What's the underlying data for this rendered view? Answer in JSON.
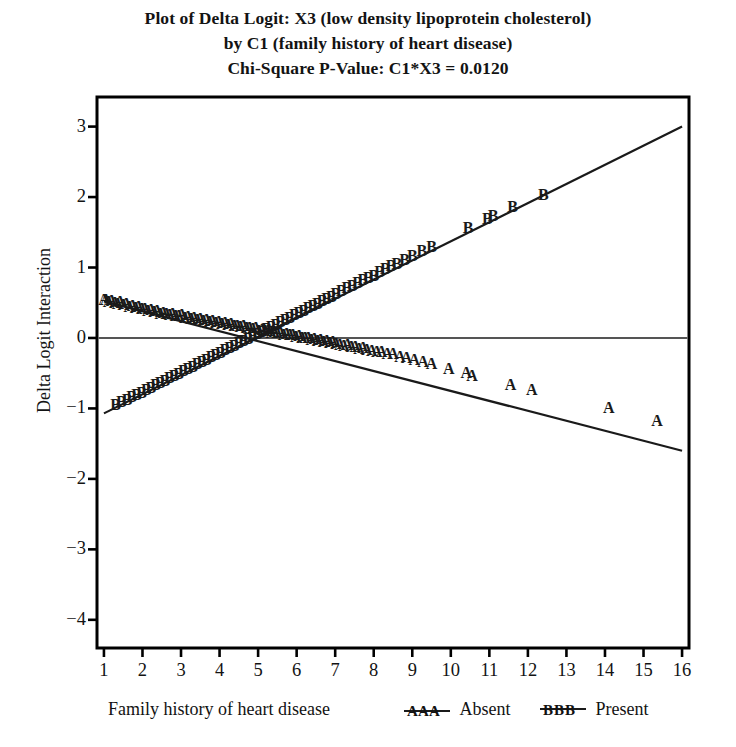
{
  "title": {
    "line1": "Plot of Delta Logit: X3 (low density lipoprotein cholesterol)",
    "line2": "by C1 (family history of heart disease)",
    "line3": "Chi-Square P-Value: C1*X3 = 0.0120"
  },
  "legend": {
    "title": "Family history of heart disease",
    "entries": [
      {
        "symbol": "AAA",
        "label": "Absent"
      },
      {
        "symbol": "BBB",
        "label": "Present"
      }
    ]
  },
  "colors": {
    "line": "#1a1a1a",
    "frame": "#000000",
    "zero_line": "#555555",
    "background": "#ffffff",
    "text": "#131313"
  },
  "chart_data": {
    "type": "scatter",
    "title": "Plot of Delta Logit: X3 (low density lipoprotein cholesterol) by C1 (family history of heart disease) Chi-Square P-Value: C1*X3 = 0.0120",
    "xlabel": "",
    "ylabel": "Delta Logit Interaction",
    "xlim": [
      0.82,
      16.18
    ],
    "ylim": [
      -4.4,
      3.42
    ],
    "xticks": [
      1,
      2,
      3,
      4,
      5,
      6,
      7,
      8,
      9,
      10,
      11,
      12,
      13,
      14,
      15,
      16
    ],
    "yticks": [
      3,
      2,
      1,
      0,
      -1,
      -2,
      -3,
      -4
    ],
    "ytick_labels": [
      "3",
      "2",
      "1",
      "0",
      "−1",
      "−2",
      "−3",
      "−4"
    ],
    "grid": false,
    "zero_reference_line": 0,
    "legend_position": "below-axes",
    "series": [
      {
        "name": "Absent",
        "marker": "A",
        "fit_line": {
          "x": [
            1,
            16
          ],
          "y": [
            0.52,
            -1.6
          ],
          "slope": -0.1413,
          "intercept": 0.6613
        },
        "points": [
          [
            1.0,
            0.56
          ],
          [
            1.05,
            0.55
          ],
          [
            1.12,
            0.52
          ],
          [
            1.2,
            0.54
          ],
          [
            1.28,
            0.51
          ],
          [
            1.35,
            0.5
          ],
          [
            1.42,
            0.52
          ],
          [
            1.5,
            0.48
          ],
          [
            1.58,
            0.49
          ],
          [
            1.66,
            0.46
          ],
          [
            1.74,
            0.47
          ],
          [
            1.82,
            0.44
          ],
          [
            1.9,
            0.45
          ],
          [
            1.98,
            0.42
          ],
          [
            2.06,
            0.43
          ],
          [
            2.14,
            0.4
          ],
          [
            2.22,
            0.41
          ],
          [
            2.3,
            0.38
          ],
          [
            2.38,
            0.39
          ],
          [
            2.46,
            0.36
          ],
          [
            2.54,
            0.37
          ],
          [
            2.62,
            0.35
          ],
          [
            2.7,
            0.34
          ],
          [
            2.78,
            0.36
          ],
          [
            2.86,
            0.33
          ],
          [
            2.94,
            0.32
          ],
          [
            3.02,
            0.34
          ],
          [
            3.1,
            0.3
          ],
          [
            3.18,
            0.31
          ],
          [
            3.26,
            0.29
          ],
          [
            3.34,
            0.3
          ],
          [
            3.42,
            0.27
          ],
          [
            3.5,
            0.28
          ],
          [
            3.58,
            0.26
          ],
          [
            3.66,
            0.27
          ],
          [
            3.74,
            0.24
          ],
          [
            3.82,
            0.25
          ],
          [
            3.9,
            0.23
          ],
          [
            3.98,
            0.24
          ],
          [
            4.06,
            0.21
          ],
          [
            4.14,
            0.22
          ],
          [
            4.22,
            0.2
          ],
          [
            4.3,
            0.21
          ],
          [
            4.38,
            0.18
          ],
          [
            4.46,
            0.19
          ],
          [
            4.54,
            0.17
          ],
          [
            4.62,
            0.18
          ],
          [
            4.7,
            0.15
          ],
          [
            4.78,
            0.16
          ],
          [
            4.86,
            0.14
          ],
          [
            4.94,
            0.15
          ],
          [
            5.02,
            0.12
          ],
          [
            5.1,
            0.13
          ],
          [
            5.18,
            0.11
          ],
          [
            5.26,
            0.12
          ],
          [
            5.34,
            0.09
          ],
          [
            5.42,
            0.1
          ],
          [
            5.5,
            0.08
          ],
          [
            5.58,
            0.09
          ],
          [
            5.66,
            0.06
          ],
          [
            5.74,
            0.07
          ],
          [
            5.82,
            0.05
          ],
          [
            5.9,
            0.06
          ],
          [
            5.98,
            0.03
          ],
          [
            6.06,
            0.04
          ],
          [
            6.14,
            0.02
          ],
          [
            6.22,
            0.01
          ],
          [
            6.3,
            0.02
          ],
          [
            6.38,
            -0.01
          ],
          [
            6.46,
            0.0
          ],
          [
            6.54,
            -0.03
          ],
          [
            6.62,
            -0.02
          ],
          [
            6.7,
            -0.04
          ],
          [
            6.78,
            -0.03
          ],
          [
            6.86,
            -0.06
          ],
          [
            6.94,
            -0.05
          ],
          [
            7.02,
            -0.07
          ],
          [
            7.12,
            -0.08
          ],
          [
            7.22,
            -0.1
          ],
          [
            7.32,
            -0.09
          ],
          [
            7.42,
            -0.12
          ],
          [
            7.52,
            -0.11
          ],
          [
            7.62,
            -0.14
          ],
          [
            7.72,
            -0.13
          ],
          [
            7.82,
            -0.16
          ],
          [
            7.95,
            -0.17
          ],
          [
            8.08,
            -0.19
          ],
          [
            8.2,
            -0.18
          ],
          [
            8.35,
            -0.22
          ],
          [
            8.5,
            -0.21
          ],
          [
            8.68,
            -0.25
          ],
          [
            8.85,
            -0.27
          ],
          [
            9.05,
            -0.3
          ],
          [
            9.28,
            -0.33
          ],
          [
            9.5,
            -0.35
          ],
          [
            9.95,
            -0.43
          ],
          [
            10.4,
            -0.48
          ],
          [
            10.55,
            -0.52
          ],
          [
            11.55,
            -0.65
          ],
          [
            12.1,
            -0.72
          ],
          [
            14.1,
            -0.98
          ],
          [
            15.35,
            -1.17
          ]
        ]
      },
      {
        "name": "Present",
        "marker": "B",
        "fit_line": {
          "x": [
            1,
            16
          ],
          "y": [
            -1.07,
            3.0
          ],
          "slope": 0.2713,
          "intercept": -1.3413
        },
        "points": [
          [
            1.3,
            -0.93
          ],
          [
            1.45,
            -0.9
          ],
          [
            1.6,
            -0.86
          ],
          [
            1.72,
            -0.83
          ],
          [
            1.85,
            -0.8
          ],
          [
            1.98,
            -0.76
          ],
          [
            2.1,
            -0.73
          ],
          [
            2.22,
            -0.7
          ],
          [
            2.34,
            -0.66
          ],
          [
            2.46,
            -0.63
          ],
          [
            2.58,
            -0.6
          ],
          [
            2.7,
            -0.56
          ],
          [
            2.82,
            -0.53
          ],
          [
            2.94,
            -0.5
          ],
          [
            3.06,
            -0.46
          ],
          [
            3.18,
            -0.43
          ],
          [
            3.3,
            -0.4
          ],
          [
            3.42,
            -0.36
          ],
          [
            3.54,
            -0.33
          ],
          [
            3.66,
            -0.3
          ],
          [
            3.78,
            -0.26
          ],
          [
            3.9,
            -0.23
          ],
          [
            4.02,
            -0.2
          ],
          [
            4.14,
            -0.16
          ],
          [
            4.26,
            -0.13
          ],
          [
            4.38,
            -0.1
          ],
          [
            4.5,
            -0.06
          ],
          [
            4.62,
            -0.03
          ],
          [
            4.74,
            0.0
          ],
          [
            4.86,
            0.04
          ],
          [
            4.98,
            0.07
          ],
          [
            5.1,
            0.1
          ],
          [
            5.22,
            0.14
          ],
          [
            5.34,
            0.17
          ],
          [
            5.46,
            0.2
          ],
          [
            5.58,
            0.24
          ],
          [
            5.7,
            0.27
          ],
          [
            5.82,
            0.3
          ],
          [
            5.94,
            0.34
          ],
          [
            6.06,
            0.37
          ],
          [
            6.18,
            0.4
          ],
          [
            6.3,
            0.44
          ],
          [
            6.42,
            0.47
          ],
          [
            6.54,
            0.5
          ],
          [
            6.66,
            0.54
          ],
          [
            6.78,
            0.57
          ],
          [
            6.9,
            0.6
          ],
          [
            7.02,
            0.64
          ],
          [
            7.16,
            0.68
          ],
          [
            7.3,
            0.72
          ],
          [
            7.44,
            0.75
          ],
          [
            7.58,
            0.79
          ],
          [
            7.72,
            0.83
          ],
          [
            7.86,
            0.87
          ],
          [
            8.0,
            0.9
          ],
          [
            8.15,
            0.95
          ],
          [
            8.3,
            0.99
          ],
          [
            8.45,
            1.03
          ],
          [
            8.6,
            1.07
          ],
          [
            8.8,
            1.12
          ],
          [
            9.0,
            1.18
          ],
          [
            9.25,
            1.25
          ],
          [
            9.5,
            1.31
          ],
          [
            10.45,
            1.57
          ],
          [
            10.95,
            1.7
          ],
          [
            11.1,
            1.75
          ],
          [
            11.6,
            1.88
          ],
          [
            12.4,
            2.05
          ]
        ]
      }
    ]
  },
  "geometry": {
    "frame": {
      "left": 97,
      "top": 97,
      "right": 689,
      "bottom": 648
    },
    "x_pixel_per_unit": 39.47,
    "y_pixel_per_unit": 68.5,
    "x1_pixel": 100,
    "y0_pixel": 327
  }
}
